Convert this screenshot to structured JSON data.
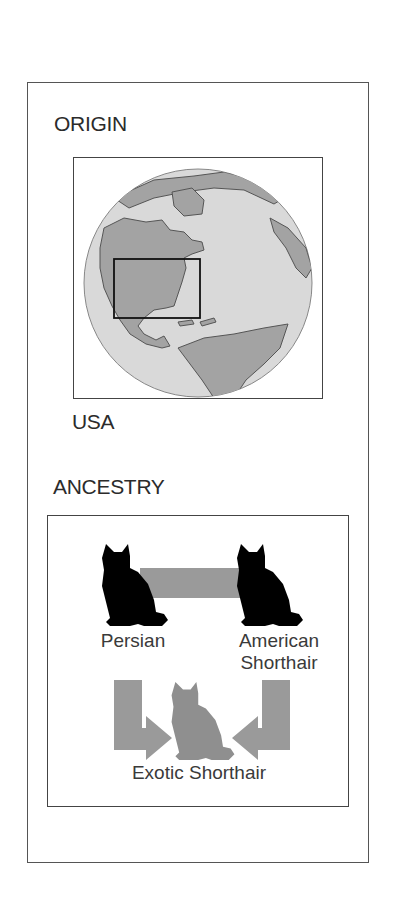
{
  "origin": {
    "heading": "ORIGIN",
    "country": "USA",
    "map": {
      "icon": "globe-icon",
      "highlight": "usa-region-box",
      "colors": {
        "ocean": "#d9d9d9",
        "land": "#a3a3a3",
        "outline": "#555555",
        "highlight_box": "#111111"
      }
    }
  },
  "ancestry": {
    "heading": "ANCESTRY",
    "parents": [
      {
        "label": "Persian",
        "icon": "cat-silhouette-icon"
      },
      {
        "label_line1": "American",
        "label_line2": "Shorthair",
        "icon": "cat-silhouette-icon"
      }
    ],
    "offspring": {
      "label": "Exotic Shorthair",
      "icon": "cat-silhouette-icon"
    },
    "colors": {
      "parent_cat": "#000000",
      "offspring_cat": "#8f8f8f",
      "connector": "#9a9a9a"
    }
  }
}
